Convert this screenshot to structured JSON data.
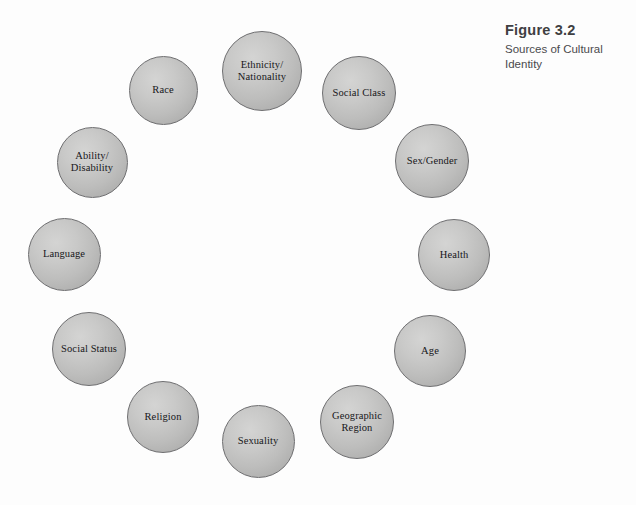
{
  "figure": {
    "title": "Figure 3.2",
    "subtitle": "Sources of Cultural Identity"
  },
  "diagram": {
    "type": "circular-concept-map",
    "background_color": "#fdfdfd",
    "circle_fill_color": "#c2c2c1",
    "circle_border_color": "#6e6e70",
    "label_color": "#17171a",
    "nodes": [
      {
        "id": "ethnicity-nationality",
        "label": "Ethnicity/\nNationality",
        "cx": 262,
        "cy": 71,
        "d": 80
      },
      {
        "id": "race",
        "label": "Race",
        "cx": 163,
        "cy": 90,
        "d": 69
      },
      {
        "id": "social-class",
        "label": "Social Class",
        "cx": 359,
        "cy": 93,
        "d": 74
      },
      {
        "id": "sex-gender",
        "label": "Sex/Gender",
        "cx": 432,
        "cy": 161,
        "d": 74
      },
      {
        "id": "ability-disability",
        "label": "Ability/\nDisability",
        "cx": 92,
        "cy": 162,
        "d": 71
      },
      {
        "id": "health",
        "label": "Health",
        "cx": 454,
        "cy": 255,
        "d": 72
      },
      {
        "id": "language",
        "label": "Language",
        "cx": 64,
        "cy": 254,
        "d": 73
      },
      {
        "id": "age",
        "label": "Age",
        "cx": 430,
        "cy": 351,
        "d": 72
      },
      {
        "id": "social-status",
        "label": "Social Status",
        "cx": 89,
        "cy": 349,
        "d": 74
      },
      {
        "id": "geographic-region",
        "label": "Geographic\nRegion",
        "cx": 357,
        "cy": 422,
        "d": 74
      },
      {
        "id": "religion",
        "label": "Religion",
        "cx": 163,
        "cy": 417,
        "d": 72
      },
      {
        "id": "sexuality",
        "label": "Sexuality",
        "cx": 258,
        "cy": 441,
        "d": 73
      }
    ]
  }
}
